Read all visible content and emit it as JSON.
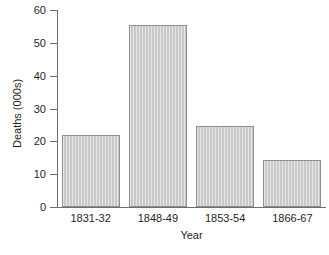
{
  "chart_data": {
    "type": "bar",
    "title": "",
    "xlabel": "Year",
    "ylabel": "Deaths (000s)",
    "categories": [
      "1831-32",
      "1848-49",
      "1853-54",
      "1866-67"
    ],
    "values": [
      22,
      55.5,
      24.6,
      14.3
    ],
    "ylim": [
      0,
      60
    ],
    "yticks": [
      0,
      10,
      20,
      30,
      40,
      50,
      60
    ],
    "ytick_labels": [
      "0",
      "10",
      "20",
      "30",
      "40",
      "50",
      "60"
    ],
    "grid": false,
    "legend": null,
    "bar_fill_color": "#c9c9c9",
    "bar_border_color": "#8f8f8f",
    "axis_color": "#6e6e6e"
  },
  "figure": {
    "caption_fragment": ""
  }
}
